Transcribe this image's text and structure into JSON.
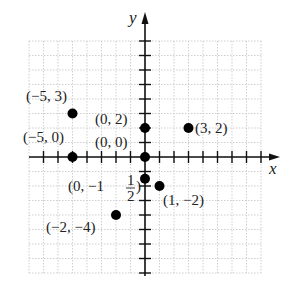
{
  "axes": {
    "x_label": "x",
    "y_label": "y",
    "origin_px": [
      145,
      157
    ],
    "unit_px": 14.5,
    "x_range": [
      -8,
      8
    ],
    "y_range": [
      -8,
      8
    ],
    "grid": "dotted, every unit",
    "colors": {
      "axis": "#111111",
      "grid": "#cfcfcf",
      "point": "#000000",
      "text": "#222222"
    }
  },
  "points": [
    {
      "x": -5,
      "y": 3,
      "label": "(−5, 3)",
      "label_pos": [
        26,
        101
      ]
    },
    {
      "x": 0,
      "y": 2,
      "label": "(0, 2)",
      "label_pos": [
        95,
        124
      ]
    },
    {
      "x": 3,
      "y": 2,
      "label": "(3, 2)",
      "label_pos": [
        195,
        133
      ]
    },
    {
      "x": -5,
      "y": 0,
      "label": "(−5, 0)",
      "label_pos": [
        23,
        142
      ]
    },
    {
      "x": 0,
      "y": 0,
      "label": "(0, 0)",
      "label_pos": [
        95,
        147
      ]
    },
    {
      "x": 0,
      "y": -1.5,
      "label": "(0, −1",
      "label_pos": [
        68,
        191
      ],
      "frac": {
        "num": "1",
        "den": "2"
      }
    },
    {
      "x": 1,
      "y": -2,
      "label": "(1, −2)",
      "label_pos": [
        163,
        205
      ]
    },
    {
      "x": -2,
      "y": -4,
      "label": "(−2, −4)",
      "label_pos": [
        46,
        232
      ]
    }
  ],
  "chart_data": {
    "type": "scatter",
    "title": "",
    "xlabel": "x",
    "ylabel": "y",
    "xlim": [
      -8,
      8
    ],
    "ylim": [
      -8,
      8
    ],
    "grid": true,
    "x": [
      -5,
      0,
      3,
      -5,
      0,
      0,
      1,
      -2
    ],
    "y": [
      3,
      2,
      2,
      0,
      0,
      -1.5,
      -2,
      -4
    ],
    "annotations": [
      "(-5, 3)",
      "(0, 2)",
      "(3, 2)",
      "(-5, 0)",
      "(0, 0)",
      "(0, -1 1/2)",
      "(1, -2)",
      "(-2, -4)"
    ]
  }
}
